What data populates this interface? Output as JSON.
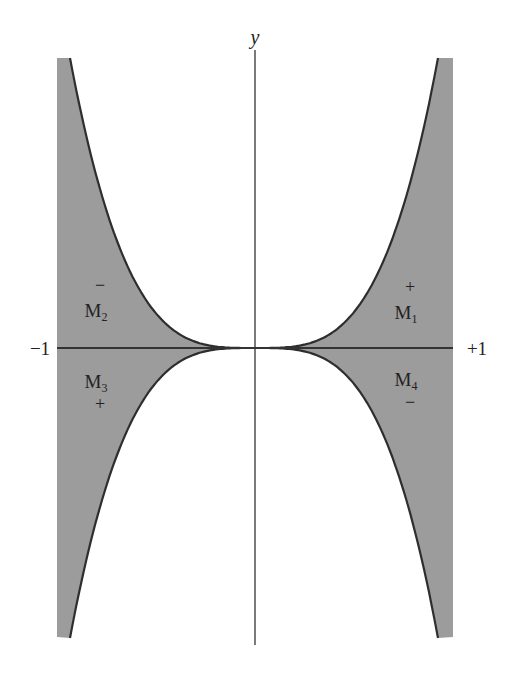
{
  "figure": {
    "axis_label_y": "y",
    "tick_left": "−1",
    "tick_right": "+1",
    "regions": [
      {
        "id": "M1",
        "base": "M",
        "sub": "1",
        "sign": "+",
        "sign_position": "above",
        "x": 410,
        "label_y": 318,
        "sign_y": 292
      },
      {
        "id": "M2",
        "base": "M",
        "sub": "2",
        "sign": "−",
        "sign_position": "above",
        "x": 100,
        "label_y": 316,
        "sign_y": 291
      },
      {
        "id": "M3",
        "base": "M",
        "sub": "3",
        "sign": "+",
        "sign_position": "below",
        "x": 100,
        "label_y": 386,
        "sign_y": 409
      },
      {
        "id": "M4",
        "base": "M",
        "sub": "4",
        "sign": "−",
        "sign_position": "below",
        "x": 410,
        "label_y": 385,
        "sign_y": 407
      }
    ]
  },
  "chart_data": {
    "type": "area",
    "title": "",
    "xlabel": "",
    "ylabel": "y",
    "x_ticks": [
      "−1",
      "+1"
    ],
    "xlim": [
      -1,
      1
    ],
    "regions": [
      {
        "name": "M1",
        "quadrant": "upper-right",
        "sign": "+"
      },
      {
        "name": "M2",
        "quadrant": "upper-left",
        "sign": "−"
      },
      {
        "name": "M3",
        "quadrant": "lower-left",
        "sign": "+"
      },
      {
        "name": "M4",
        "quadrant": "lower-right",
        "sign": "−"
      }
    ],
    "fill_color": "#9a9a9a",
    "line_color": "#333333"
  }
}
